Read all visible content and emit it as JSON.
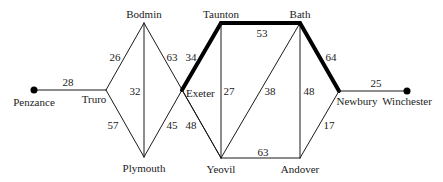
{
  "diagram": {
    "type": "weighted-graph",
    "highlighted_path": [
      "Exeter",
      "Taunton",
      "Bath",
      "Newbury"
    ],
    "nodes": [
      {
        "id": "Penzance",
        "label": "Penzance",
        "x": 34,
        "y": 90,
        "dot": true,
        "lx": 34,
        "ly": 106,
        "anchor": "middle"
      },
      {
        "id": "Truro",
        "label": "Truro",
        "x": 106,
        "y": 90,
        "dot": false,
        "lx": 94,
        "ly": 103,
        "anchor": "middle"
      },
      {
        "id": "Bodmin",
        "label": "Bodmin",
        "x": 144,
        "y": 23,
        "dot": false,
        "lx": 144,
        "ly": 18,
        "anchor": "middle"
      },
      {
        "id": "Plymouth",
        "label": "Plymouth",
        "x": 144,
        "y": 157,
        "dot": false,
        "lx": 144,
        "ly": 172,
        "anchor": "middle"
      },
      {
        "id": "Exeter",
        "label": "Exeter",
        "x": 182,
        "y": 90,
        "dot": false,
        "lx": 186,
        "ly": 97,
        "anchor": "start"
      },
      {
        "id": "Taunton",
        "label": "Taunton",
        "x": 221,
        "y": 23,
        "dot": false,
        "lx": 221,
        "ly": 18,
        "anchor": "middle"
      },
      {
        "id": "Bath",
        "label": "Bath",
        "x": 300,
        "y": 23,
        "dot": false,
        "lx": 300,
        "ly": 18,
        "anchor": "middle"
      },
      {
        "id": "Yeovil",
        "label": "Yeovil",
        "x": 221,
        "y": 158,
        "dot": false,
        "lx": 221,
        "ly": 173,
        "anchor": "middle"
      },
      {
        "id": "Andover",
        "label": "Andover",
        "x": 300,
        "y": 158,
        "dot": false,
        "lx": 300,
        "ly": 173,
        "anchor": "middle"
      },
      {
        "id": "Newbury",
        "label": "Newbury",
        "x": 339,
        "y": 91,
        "dot": false,
        "lx": 357,
        "ly": 105,
        "anchor": "middle"
      },
      {
        "id": "Winchester",
        "label": "Winchester",
        "x": 407,
        "y": 91,
        "dot": true,
        "lx": 407,
        "ly": 105,
        "anchor": "middle"
      }
    ],
    "edges": [
      {
        "from": "Penzance",
        "to": "Truro",
        "weight": "28",
        "bold": false,
        "wx": 68,
        "wy": 86
      },
      {
        "from": "Truro",
        "to": "Bodmin",
        "weight": "26",
        "bold": false,
        "wx": 115,
        "wy": 61
      },
      {
        "from": "Truro",
        "to": "Plymouth",
        "weight": "57",
        "bold": false,
        "wx": 113,
        "wy": 129
      },
      {
        "from": "Bodmin",
        "to": "Plymouth",
        "weight": "32",
        "bold": false,
        "wx": 135,
        "wy": 95
      },
      {
        "from": "Bodmin",
        "to": "Yeovil",
        "weight": "63",
        "bold": false,
        "wx": 172,
        "wy": 61
      },
      {
        "from": "Plymouth",
        "to": "Exeter",
        "weight": "45",
        "bold": false,
        "wx": 172,
        "wy": 129
      },
      {
        "from": "Exeter",
        "to": "Taunton",
        "weight": "34",
        "bold": true,
        "wx": 191,
        "wy": 61
      },
      {
        "from": "Exeter",
        "to": "Yeovil",
        "weight": "48",
        "bold": false,
        "wx": 191,
        "wy": 129
      },
      {
        "from": "Taunton",
        "to": "Bath",
        "weight": "53",
        "bold": true,
        "wx": 262,
        "wy": 37
      },
      {
        "from": "Taunton",
        "to": "Yeovil",
        "weight": "27",
        "bold": false,
        "wx": 229,
        "wy": 95
      },
      {
        "from": "Bath",
        "to": "Yeovil",
        "weight": "38",
        "bold": false,
        "wx": 270,
        "wy": 95
      },
      {
        "from": "Bath",
        "to": "Andover",
        "weight": "48",
        "bold": false,
        "wx": 309,
        "wy": 95
      },
      {
        "from": "Bath",
        "to": "Newbury",
        "weight": "64",
        "bold": true,
        "wx": 331,
        "wy": 61
      },
      {
        "from": "Yeovil",
        "to": "Andover",
        "weight": "63",
        "bold": false,
        "wx": 263,
        "wy": 156
      },
      {
        "from": "Andover",
        "to": "Newbury",
        "weight": "17",
        "bold": false,
        "wx": 329,
        "wy": 129
      },
      {
        "from": "Newbury",
        "to": "Winchester",
        "weight": "25",
        "bold": false,
        "wx": 376,
        "wy": 87
      }
    ],
    "colors": {
      "line": "#1a1a1a",
      "bold_line": "#000000",
      "background": "#ffffff"
    }
  }
}
